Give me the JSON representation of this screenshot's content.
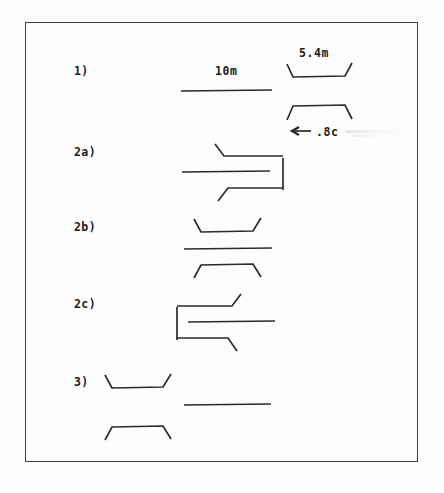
{
  "figure": {
    "title_present": false,
    "border_color": "#3c3c3c",
    "ink_color": "#2b2b2b",
    "background_color": "#fdfdfd"
  },
  "rows": [
    {
      "key": "row-1",
      "label": "1)"
    },
    {
      "key": "row-2a",
      "label": "2a)"
    },
    {
      "key": "row-2b",
      "label": "2b)"
    },
    {
      "key": "row-2c",
      "label": "2c)"
    },
    {
      "key": "row-3",
      "label": "3)"
    }
  ],
  "annotations": {
    "length_10m": "10m",
    "length_5_4m": "5.4m",
    "offset_08c": ".8c",
    "arrow_direction": "left"
  },
  "icons": {
    "left_arrow": "left-arrow-icon"
  }
}
